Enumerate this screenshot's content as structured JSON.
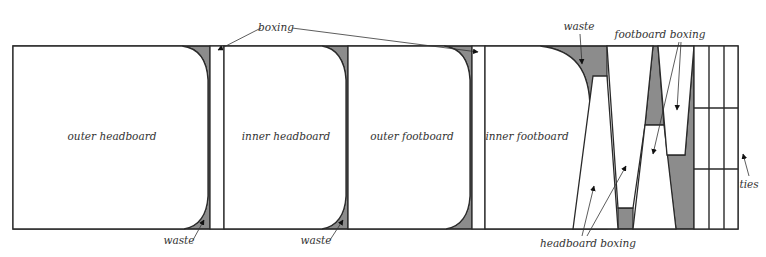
{
  "diagram": {
    "colors": {
      "waste": "#8c8c8c",
      "stroke": "#2a2a2a",
      "background": "#ffffff"
    },
    "panels": [
      {
        "id": "outer-headboard",
        "label": "outer headboard"
      },
      {
        "id": "inner-headboard",
        "label": "inner headboard"
      },
      {
        "id": "outer-footboard",
        "label": "outer footboard"
      },
      {
        "id": "inner-footboard",
        "label": "inner footboard"
      }
    ],
    "callouts": {
      "boxing": "boxing",
      "waste_top": "waste",
      "footboard_boxing": "footboard boxing",
      "waste_bottom_1": "waste",
      "waste_bottom_2": "waste",
      "headboard_boxing": "headboard boxing",
      "ties": "ties"
    }
  }
}
